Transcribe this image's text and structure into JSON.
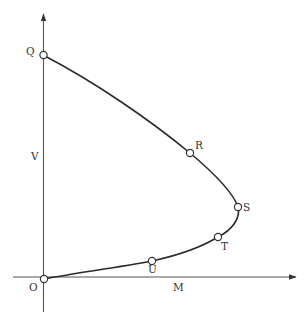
{
  "diagram": {
    "type": "curve-on-axes",
    "axes": {
      "x_label": "M",
      "y_label": "V",
      "origin_label": "O"
    },
    "points": [
      {
        "label": "Q",
        "x": 43,
        "y": 55
      },
      {
        "label": "R",
        "x": 190,
        "y": 153
      },
      {
        "label": "S",
        "x": 238,
        "y": 207
      },
      {
        "label": "T",
        "x": 218,
        "y": 237
      },
      {
        "label": "U",
        "x": 152,
        "y": 261
      },
      {
        "label": "O",
        "x": 44,
        "y": 279
      }
    ],
    "colors": {
      "axis": "#555555",
      "curve": "#2a2a2a",
      "point_fill": "#ffffff"
    }
  }
}
